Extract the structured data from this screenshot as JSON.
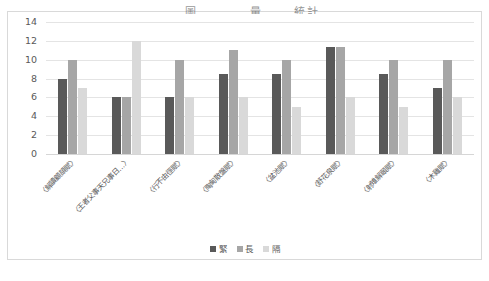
{
  "chart_data": {
    "type": "bar",
    "title": "圖　　　　量　 　統計　　　　",
    "xlabel": "",
    "ylabel": "",
    "ylim": [
      0,
      14
    ],
    "ytick_step": 2,
    "yticks": [
      14,
      12,
      10,
      8,
      6,
      4,
      2,
      0
    ],
    "grid": true,
    "legend_position": "bottom",
    "categories": [
      "〈解讀顧頡賦〉",
      "〈王者父事天兄事日…〉",
      "〈行不由徑賦〉",
      "〈陶甸散盤賦〉",
      "〈盆池賦〉",
      "〈舒花泉賦〉",
      "〈射雉解頤賦〉",
      "〈木雞賦〉"
    ],
    "series": [
      {
        "name": "緊",
        "color": "#595959",
        "values": [
          8,
          6,
          6,
          8.5,
          8.5,
          11.3,
          8.5,
          7
        ]
      },
      {
        "name": "長",
        "color": "#a6a6a6",
        "values": [
          10,
          6,
          10,
          11,
          10,
          11.3,
          10,
          10
        ]
      },
      {
        "name": "隔",
        "color": "#d9d9d9",
        "values": [
          7,
          12,
          6,
          6,
          5,
          6,
          5,
          6
        ]
      }
    ]
  }
}
